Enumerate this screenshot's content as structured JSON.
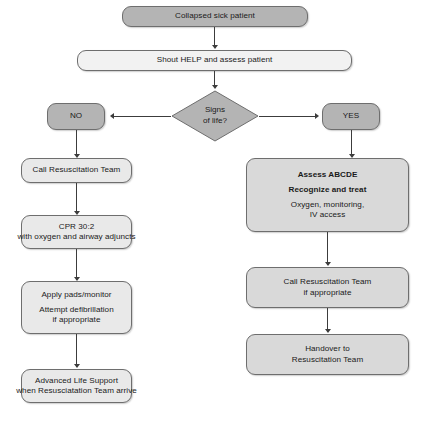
{
  "diagram": {
    "colors": {
      "emphasis_fill": "#b4b4b4",
      "plain_fill": "#f2f2f2",
      "left_branch_fill": "#e9e9e9",
      "right_branch_fill": "#d9d9d9",
      "node_border": "#6e6e6e",
      "connector": "#3c3c3c"
    },
    "nodes": {
      "start": {
        "label": "Collapsed sick patient"
      },
      "shout": {
        "label": "Shout HELP and assess patient"
      },
      "decision": {
        "line1": "Signs",
        "line2": "of life?"
      },
      "branch_no": {
        "label": "NO"
      },
      "branch_yes": {
        "label": "YES"
      },
      "call_team_left": {
        "label": "Call Resuscitation Team"
      },
      "cpr": {
        "line1": "CPR 30:2",
        "line2": "with oxygen and airway adjuncts"
      },
      "pads": {
        "line1": "Apply pads/monitor",
        "line2": "Attempt defibrillation",
        "line3": "if appropriate"
      },
      "als": {
        "line1": "Advanced Life Support",
        "line2": "when Resusciatation Team arrive"
      },
      "assess": {
        "line1": "Assess ABCDE",
        "line2": "Recognize and treat",
        "line3": "Oxygen, monitoring,",
        "line4": "IV access"
      },
      "call_team_right": {
        "line1": "Call Resuscitation Team",
        "line2": "if appropriate"
      },
      "handover": {
        "line1": "Handover to",
        "line2": "Resuscitation Team"
      }
    },
    "caption": {
      "text": ""
    }
  }
}
